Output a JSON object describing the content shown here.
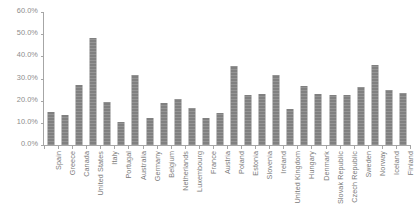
{
  "chart_data": {
    "type": "bar",
    "title": "",
    "subtitle": "",
    "xlabel": "",
    "ylabel": "",
    "legend": [],
    "legend_position": "none",
    "grid": false,
    "ylim": [
      0,
      60
    ],
    "ytick_labels": [
      "0.0%",
      "10.0%",
      "20.0%",
      "30.0%",
      "40.0%",
      "50.0%",
      "60.0%"
    ],
    "ytick_values": [
      0,
      10,
      20,
      30,
      40,
      50,
      60
    ],
    "value_suffix": "%",
    "bar_color": "#808080",
    "axis_color": "#a6a6a6",
    "label_color": "#7a7a7a",
    "categories": [
      "Spain",
      "Greece",
      "Canada",
      "United States",
      "Italy",
      "Portugal",
      "Australia",
      "Germany",
      "Belgium",
      "Netherlands",
      "Luxembourg",
      "France",
      "Austria",
      "Poland",
      "Estonia",
      "Slovenia",
      "Ireland",
      "United Kingdom",
      "Hungary",
      "Denmark",
      "Slovak Republic",
      "Czech Republic",
      "Sweden",
      "Norway",
      "Iceland",
      "Finland"
    ],
    "values": [
      14.8,
      13.6,
      27.2,
      48.4,
      19.6,
      10.3,
      31.4,
      12.2,
      18.9,
      20.8,
      16.6,
      12.4,
      14.3,
      35.6,
      22.4,
      23.0,
      31.5,
      16.3,
      26.5,
      22.8,
      22.6,
      22.7,
      26.3,
      36.2,
      24.6,
      23.6
    ]
  }
}
